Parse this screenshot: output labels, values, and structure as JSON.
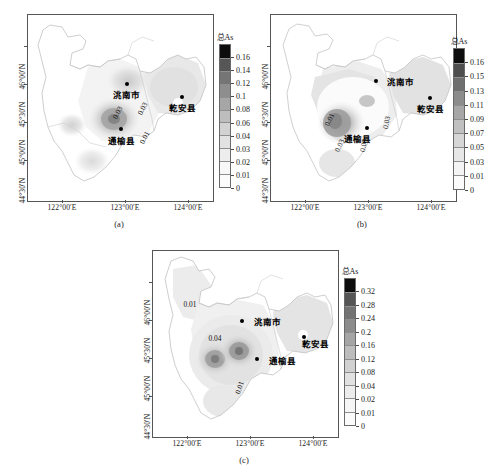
{
  "figure": {
    "title": "",
    "panels": [
      {
        "id": "a",
        "caption": "(a)",
        "legend_title": "总As",
        "xticks": [
          "122°00′E",
          "123°00′E",
          "124°00′E"
        ],
        "yticks": [
          "46°00′N",
          "45°30′N",
          "45°00′N",
          "44°30′N"
        ],
        "colorbar_labels": [
          "0.16",
          "0.14",
          "0.12",
          "0.1",
          "0.08",
          "0.06",
          "0.04",
          "0.03",
          "0.02",
          "0.01",
          "0"
        ],
        "colorbar_colors": [
          "#0d0d0d",
          "#565656",
          "#757575",
          "#8e8e8e",
          "#a6a6a6",
          "#bdbdbd",
          "#d2d2d2",
          "#e2e2e2",
          "#ededed",
          "#f7f7f7",
          "#fbfbfb"
        ],
        "cities": [
          {
            "name": "洮南市",
            "x": 53.5,
            "y": 37.0
          },
          {
            "name": "乾安县",
            "x": 83.5,
            "y": 44.0
          },
          {
            "name": "通榆县",
            "x": 50.5,
            "y": 61.5
          }
        ],
        "contours": [
          {
            "label": "0.03",
            "x": 45.0,
            "y": 50.0,
            "rot": -62
          },
          {
            "label": "0.03",
            "x": 58.5,
            "y": 48.0,
            "rot": -62
          },
          {
            "label": "0.01",
            "x": 59.5,
            "y": 63.5,
            "rot": -62
          }
        ]
      },
      {
        "id": "b",
        "caption": "(b)",
        "legend_title": "总As",
        "xticks": [
          "122°00′E",
          "123°00′E",
          "124°00′E"
        ],
        "yticks": [
          "46°00′N",
          "45°30′N",
          "45°00′N",
          "44°30′N"
        ],
        "colorbar_labels": [
          "0.16",
          "0.15",
          "0.13",
          "0.11",
          "0.09",
          "0.07",
          "0.05",
          "0.03",
          "0.01",
          "0"
        ],
        "colorbar_colors": [
          "#0d0d0d",
          "#4e4e4e",
          "#6f6f6f",
          "#8c8c8c",
          "#a7a7a7",
          "#c0c0c0",
          "#d6d6d6",
          "#e7e7e7",
          "#f4f4f4",
          "#fbfbfb"
        ],
        "cities": [
          {
            "name": "洮南市",
            "x": 57.0,
            "y": 35.5
          },
          {
            "name": "乾安县",
            "x": 86.0,
            "y": 44.5
          },
          {
            "name": "通榆县",
            "x": 52.0,
            "y": 60.5
          }
        ],
        "contours": [
          {
            "label": "0.01",
            "x": 28.0,
            "y": 53.5,
            "rot": -66
          },
          {
            "label": "0.03",
            "x": 33.5,
            "y": 68.0,
            "rot": -66
          },
          {
            "label": "0.09",
            "x": 46.5,
            "y": 67.5,
            "rot": -80
          },
          {
            "label": "0.03",
            "x": 59.0,
            "y": 55.5,
            "rot": -80
          }
        ]
      },
      {
        "id": "c",
        "caption": "(c)",
        "legend_title": "总As",
        "xticks": [
          "122°00′E",
          "123°00′E",
          "124°00′E"
        ],
        "yticks": [
          "46°00′N",
          "45°30′N",
          "45°00′N",
          "44°30′N"
        ],
        "colorbar_labels": [
          "0.32",
          "0.28",
          "0.24",
          "0.2",
          "0.16",
          "0.12",
          "0.08",
          "0.04",
          "0.02",
          "0.01",
          "0"
        ],
        "colorbar_colors": [
          "#0d0d0d",
          "#555555",
          "#737373",
          "#8c8c8c",
          "#a5a5a5",
          "#bcbcbc",
          "#d1d1d1",
          "#e1e1e1",
          "#ececec",
          "#f6f6f6",
          "#fbfbfb"
        ],
        "cities": [
          {
            "name": "洮南市",
            "x": 48.0,
            "y": 37.5
          },
          {
            "name": "乾安县",
            "x": 81.5,
            "y": 46.5
          },
          {
            "name": "通榆县",
            "x": 56.0,
            "y": 58.0
          }
        ],
        "contours": [
          {
            "label": "0.01",
            "x": 16.5,
            "y": 26.5,
            "rot": 0
          },
          {
            "label": "0.04",
            "x": 30.0,
            "y": 44.5,
            "rot": 0
          },
          {
            "label": "0.01",
            "x": 43.5,
            "y": 71.0,
            "rot": -72
          }
        ]
      }
    ]
  },
  "chart_data": {
    "type": "heatmap",
    "title": "",
    "xlabel": "Longitude",
    "ylabel": "Latitude",
    "xlim": [
      "121°40′E",
      "124°20′E"
    ],
    "ylim": [
      "44°20′N",
      "46°10′N"
    ],
    "grid": false,
    "legend_position": "right",
    "panels": [
      {
        "id": "a",
        "caption": "(a)",
        "variable": "总As",
        "levels": [
          0,
          0.01,
          0.02,
          0.03,
          0.04,
          0.06,
          0.08,
          0.1,
          0.12,
          0.14,
          0.16
        ],
        "tick_labels": [
          "0",
          "0.01",
          "0.02",
          "0.03",
          "0.04",
          "0.06",
          "0.08",
          "0.1",
          "0.12",
          "0.14",
          "0.16"
        ],
        "contour_labels": [
          0.03,
          0.03,
          0.01
        ],
        "max_value": 0.16,
        "min_value": 0
      },
      {
        "id": "b",
        "caption": "(b)",
        "variable": "总As",
        "levels": [
          0,
          0.01,
          0.03,
          0.05,
          0.07,
          0.09,
          0.11,
          0.13,
          0.15,
          0.16
        ],
        "tick_labels": [
          "0",
          "0.01",
          "0.03",
          "0.05",
          "0.07",
          "0.09",
          "0.11",
          "0.13",
          "0.15",
          "0.16"
        ],
        "contour_labels": [
          0.01,
          0.03,
          0.09,
          0.03
        ],
        "max_value": 0.16,
        "min_value": 0
      },
      {
        "id": "c",
        "caption": "(c)",
        "variable": "总As",
        "levels": [
          0,
          0.01,
          0.02,
          0.04,
          0.08,
          0.12,
          0.16,
          0.2,
          0.24,
          0.28,
          0.32
        ],
        "tick_labels": [
          "0",
          "0.01",
          "0.02",
          "0.04",
          "0.08",
          "0.12",
          "0.16",
          "0.2",
          "0.24",
          "0.28",
          "0.32"
        ],
        "contour_labels": [
          0.01,
          0.04,
          0.01
        ],
        "max_value": 0.32,
        "min_value": 0
      }
    ],
    "sites": [
      "洮南市",
      "乾安县",
      "通榆县"
    ]
  }
}
